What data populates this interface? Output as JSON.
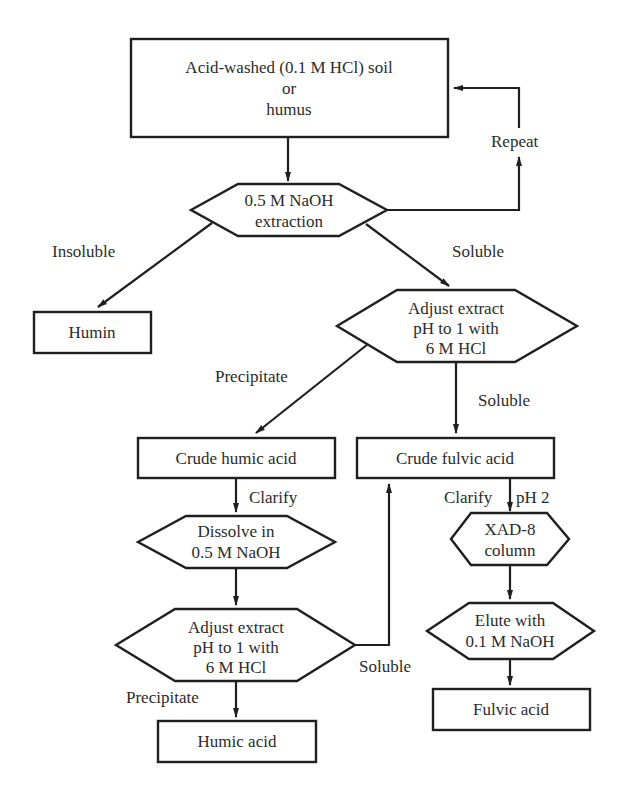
{
  "diagram": {
    "nodes": {
      "start": {
        "lines": [
          "Acid-washed (0.1 M HCl) soil",
          "or",
          "humus"
        ]
      },
      "naoh_extraction": {
        "lines": [
          "0.5 M NaOH",
          "extraction"
        ]
      },
      "humin": {
        "lines": [
          "Humin"
        ]
      },
      "adjust_ph_1": {
        "lines": [
          "Adjust extract",
          "pH to 1 with",
          "6 M HCl"
        ]
      },
      "crude_humic": {
        "lines": [
          "Crude humic acid"
        ]
      },
      "crude_fulvic": {
        "lines": [
          "Crude fulvic acid"
        ]
      },
      "dissolve": {
        "lines": [
          "Dissolve in",
          "0.5 M NaOH"
        ]
      },
      "xad8": {
        "lines": [
          "XAD-8",
          "column"
        ]
      },
      "adjust_ph_2": {
        "lines": [
          "Adjust extract",
          "pH to 1 with",
          "6 M HCl"
        ]
      },
      "elute": {
        "lines": [
          "Elute with",
          "0.1 M NaOH"
        ]
      },
      "fulvic_acid": {
        "lines": [
          "Fulvic acid"
        ]
      },
      "humic_acid": {
        "lines": [
          "Humic acid"
        ]
      }
    },
    "edge_labels": {
      "repeat": "Repeat",
      "insoluble": "Insoluble",
      "soluble_1": "Soluble",
      "precipitate_1": "Precipitate",
      "soluble_2": "Soluble",
      "clarify_humic": "Clarify",
      "clarify_fulvic": "Clarify",
      "ph2": "pH 2",
      "soluble_3": "Soluble",
      "precipitate_2": "Precipitate"
    }
  }
}
